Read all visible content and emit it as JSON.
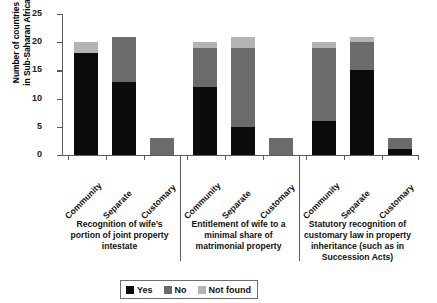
{
  "chart_data": {
    "type": "bar",
    "stacked": true,
    "title": "",
    "xlabel": "",
    "ylabel": "Number of countries in Sub-Saharan Africa",
    "ylabel_lines": [
      "Number of countries",
      "in Sub-Saharan Africa"
    ],
    "ylim": [
      0,
      25
    ],
    "yticks": [
      0,
      5,
      10,
      15,
      20,
      25
    ],
    "ytick_labels": [
      "0",
      "5",
      "10",
      "15",
      "20",
      "25"
    ],
    "grid": false,
    "legend_position": "bottom",
    "categories": [
      "Community",
      "Separate",
      "Customary"
    ],
    "series": [
      {
        "name": "Yes",
        "color": "#0b0b0b"
      },
      {
        "name": "No",
        "color": "#6b6b6b"
      },
      {
        "name": "Not found",
        "color": "#b4b4b4"
      }
    ],
    "groups": [
      {
        "caption": "Recognition of wife’s portion of joint property intestate",
        "caption_lines": [
          "Recognition of wife’s",
          "portion of joint property",
          "intestate"
        ],
        "bars": [
          {
            "category": "Community",
            "yes": 18,
            "no": 0,
            "not_found": 2,
            "total": 20
          },
          {
            "category": "Separate",
            "yes": 13,
            "no": 8,
            "not_found": 0,
            "total": 21
          },
          {
            "category": "Customary",
            "yes": 0,
            "no": 3,
            "not_found": 0,
            "total": 3
          }
        ]
      },
      {
        "caption": "Entitlement of wife to a minimal share of matrimonial property",
        "caption_lines": [
          "Entitlement of wife to a",
          "minimal share of",
          "matrimonial property"
        ],
        "bars": [
          {
            "category": "Community",
            "yes": 12,
            "no": 7,
            "not_found": 1,
            "total": 20
          },
          {
            "category": "Separate",
            "yes": 5,
            "no": 14,
            "not_found": 2,
            "total": 21
          },
          {
            "category": "Customary",
            "yes": 0,
            "no": 3,
            "not_found": 0,
            "total": 3
          }
        ]
      },
      {
        "caption": "Statutory recognition of customary law in property inheritance (such as in Succession Acts)",
        "caption_lines": [
          "Statutory recognition of",
          "customary law in property",
          "inheritance (such as in",
          "Succession Acts)"
        ],
        "bars": [
          {
            "category": "Community",
            "yes": 6,
            "no": 13,
            "not_found": 1,
            "total": 20
          },
          {
            "category": "Separate",
            "yes": 15,
            "no": 5,
            "not_found": 1,
            "total": 21
          },
          {
            "category": "Customary",
            "yes": 1,
            "no": 2,
            "not_found": 0,
            "total": 3
          }
        ]
      }
    ]
  },
  "legend": {
    "items": [
      {
        "label": "Yes",
        "color": "#0b0b0b"
      },
      {
        "label": "No",
        "color": "#6b6b6b"
      },
      {
        "label": "Not found",
        "color": "#b4b4b4"
      }
    ]
  }
}
